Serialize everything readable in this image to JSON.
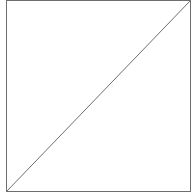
{
  "diagram": {
    "shape": "square-with-diagonal",
    "colors": {
      "background": "#ffffff",
      "stroke": "#6e6e6e"
    },
    "square": {
      "x1": 6.5,
      "y1": 0.5,
      "x2": 190.5,
      "y2": 191.5
    },
    "diagonal": {
      "from": [
        6.5,
        191.5
      ],
      "to": [
        190.5,
        0.5
      ]
    }
  }
}
